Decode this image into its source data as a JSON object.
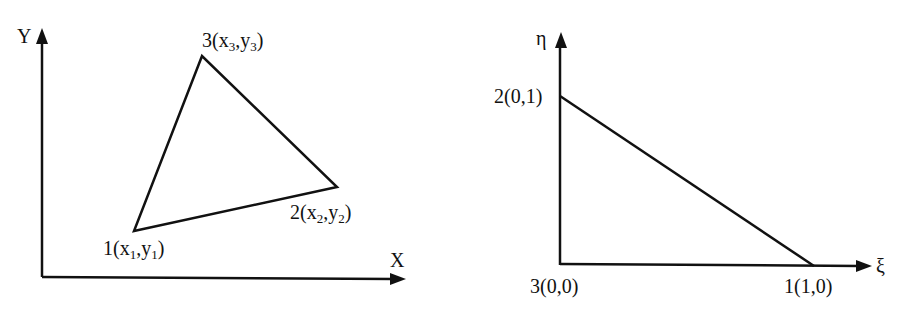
{
  "global_diagram": {
    "x_axis_label": "X",
    "y_axis_label": "Y",
    "nodes": [
      {
        "id": "1",
        "prefix": "1(x",
        "sub_a": "1",
        "mid": ",y",
        "sub_b": "1",
        "suffix": ")"
      },
      {
        "id": "2",
        "prefix": "2(x",
        "sub_a": "2",
        "mid": ",y",
        "sub_b": "2",
        "suffix": ")"
      },
      {
        "id": "3",
        "prefix": "3(x",
        "sub_a": "3",
        "mid": ",y",
        "sub_b": "3",
        "suffix": ")"
      }
    ]
  },
  "natural_diagram": {
    "x_axis_label": "ξ",
    "y_axis_label": "η",
    "nodes": [
      {
        "id": "1",
        "label": "1(1,0)"
      },
      {
        "id": "2",
        "label": "2(0,1)"
      },
      {
        "id": "3",
        "label": "3(0,0)"
      }
    ]
  },
  "colors": {
    "stroke": "#111111",
    "background": "#ffffff"
  }
}
